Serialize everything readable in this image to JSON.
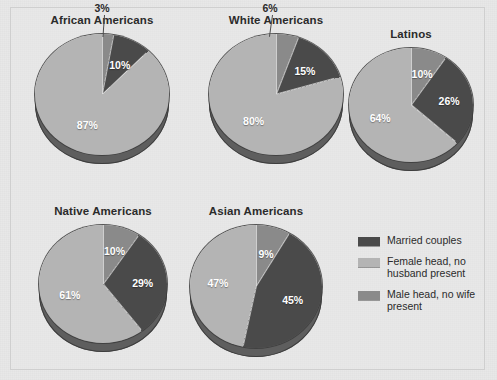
{
  "figure": {
    "background_color": "#e8e8e8",
    "frame_color": "#cfcfcf"
  },
  "colors": {
    "married": "#4a4a4a",
    "female_head": "#b4b4b4",
    "male_head": "#8a8a8a",
    "depth": "#5e5e5e",
    "label_light": "#ffffff",
    "label_dark": "#2b2b2b"
  },
  "legend": {
    "items": [
      {
        "label": "Married couples",
        "color_key": "married",
        "swatch": "#4a4a4a"
      },
      {
        "label": "Female head, no husband present",
        "color_key": "female_head",
        "swatch": "#b4b4b4"
      },
      {
        "label": "Male head, no wife present",
        "color_key": "male_head",
        "swatch": "#8a8a8a"
      }
    ]
  },
  "chart_data": {
    "type": "pie",
    "title": "",
    "legend_position": "bottom-right",
    "series_names": [
      "Married couples",
      "Female head, no husband present",
      "Male head, no wife present"
    ],
    "units": "percent",
    "charts": [
      {
        "title": "African Americans",
        "categories": [
          "Male head, no wife present",
          "Married couples",
          "Female head, no husband present"
        ],
        "values": [
          3,
          10,
          87
        ],
        "labels": [
          "3%",
          "10%",
          "87%"
        ]
      },
      {
        "title": "White Americans",
        "categories": [
          "Male head, no wife present",
          "Married couples",
          "Female head, no husband present"
        ],
        "values": [
          6,
          15,
          80
        ],
        "labels": [
          "6%",
          "15%",
          "80%"
        ]
      },
      {
        "title": "Latinos",
        "categories": [
          "Male head, no wife present",
          "Married couples",
          "Female head, no husband present"
        ],
        "values": [
          10,
          26,
          64
        ],
        "labels": [
          "10%",
          "26%",
          "64%"
        ]
      },
      {
        "title": "Native Americans",
        "categories": [
          "Male head, no wife present",
          "Married couples",
          "Female head, no husband present"
        ],
        "values": [
          10,
          29,
          61
        ],
        "labels": [
          "10%",
          "29%",
          "61%"
        ]
      },
      {
        "title": "Asian Americans",
        "categories": [
          "Male head, no wife present",
          "Married couples",
          "Female head, no husband present"
        ],
        "values": [
          9,
          45,
          47
        ],
        "labels": [
          "9%",
          "45%",
          "47%"
        ]
      }
    ]
  }
}
